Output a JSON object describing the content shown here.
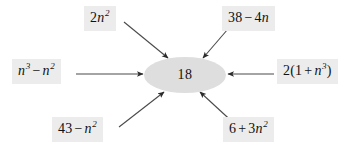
{
  "figure": {
    "center": {
      "value": "18",
      "shape": "ellipse",
      "fill_color": "#dedede"
    },
    "colors": {
      "background": "#ffffff",
      "label_box": "#ececec",
      "text": "#111111",
      "arrow": "#3a3a3a"
    },
    "terms": [
      {
        "id": "top-left",
        "text": "2n²",
        "coef": "2",
        "base": "n",
        "exponent": "2",
        "arrow_direction": "down-right"
      },
      {
        "id": "top-right",
        "text": "38 − 4n",
        "lhs": "38",
        "operator": "−",
        "rhs": "4n",
        "arrow_direction": "down-left"
      },
      {
        "id": "left",
        "text": "n³ − n²",
        "lhs_base": "n",
        "lhs_exponent": "3",
        "operator": "−",
        "rhs_base": "n",
        "rhs_exponent": "2",
        "arrow_direction": "right"
      },
      {
        "id": "right",
        "text": "2(1 + n³)",
        "coef": "2",
        "inner_lhs": "1",
        "operator": "+",
        "inner_base": "n",
        "inner_exponent": "3",
        "arrow_direction": "left"
      },
      {
        "id": "bottom-left",
        "text": "43 − n²",
        "lhs": "43",
        "operator": "−",
        "rhs_base": "n",
        "rhs_exponent": "2",
        "arrow_direction": "up-right"
      },
      {
        "id": "bottom-right",
        "text": "6 + 3n²",
        "lhs": "6",
        "operator": "+",
        "rhs_coef": "3",
        "rhs_base": "n",
        "rhs_exponent": "2",
        "arrow_direction": "up-left"
      }
    ],
    "glyphs": {
      "minus": "−",
      "plus": "+",
      "paren_open": "(",
      "paren_close": ")",
      "n": "n",
      "two": "2",
      "three": "3",
      "four": "4",
      "six": "6",
      "thirty_eight": "38",
      "forty_three": "43",
      "one": "1"
    }
  }
}
